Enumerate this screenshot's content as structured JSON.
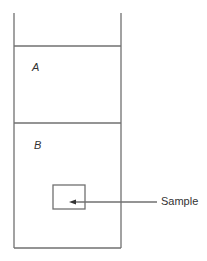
{
  "diagram": {
    "zones": [
      {
        "label": "A"
      },
      {
        "label": "B"
      }
    ],
    "callout": {
      "label": "Sample"
    },
    "colors": {
      "line": "#6e6e6e",
      "text": "#333333"
    }
  }
}
